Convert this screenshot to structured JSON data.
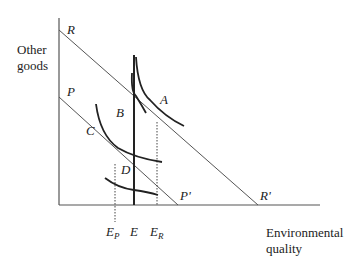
{
  "diagram": {
    "type": "indifference-curve diagram",
    "axes": {
      "y_label_line1": "Other",
      "y_label_line2": "goods",
      "x_label_line1": "Environmental",
      "x_label_line2": "quality"
    },
    "budget_lines": [
      {
        "id": "R",
        "start_label": "R",
        "end_label": "R'"
      },
      {
        "id": "P",
        "start_label": "P",
        "end_label": "P'"
      }
    ],
    "points": {
      "A": "A",
      "B": "B",
      "C": "C",
      "D": "D"
    },
    "x_markers": {
      "Ep_main": "E",
      "Ep_sub": "P",
      "E": "E",
      "Er_main": "E",
      "Er_sub": "R"
    }
  }
}
